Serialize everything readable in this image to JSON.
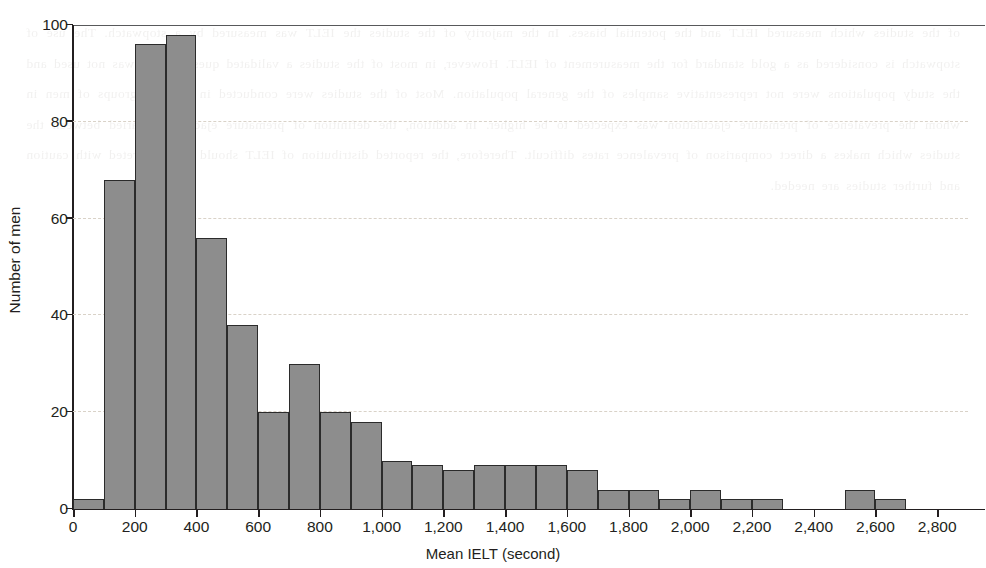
{
  "figure": {
    "y_axis_title": "Number of men",
    "x_axis_title": "Mean IELT (second)",
    "bar_fill_color": "#8d8d8d",
    "bar_stroke_color": "#2b2b2b",
    "gridline_color": "#d9d2c8",
    "axis_color": "#231f20"
  },
  "background_text": "of the studies which measured IELT and the potential biases. In the majority of the studies the IELT was measured by a stopwatch. The use of stopwatch is considered as a gold standard for the measurement of IELT. However, in most of the studies a validated questionnaire was not used and the study populations were not representative samples of the general population. Most of the studies were conducted in selected groups of men in whom the prevalence of premature ejaculation was expected to be higher. In addition, the definition of premature ejaculation varied between the studies which makes a direct comparison of prevalence rates difficult. Therefore, the reported distribution of IELT should be interpreted with caution and further studies are needed.",
  "chart_data": {
    "type": "bar",
    "title": "",
    "subtitle": "",
    "xlabel": "Mean IELT (second)",
    "ylabel": "Number of men",
    "bin_width": 100,
    "xlim": [
      0,
      2900
    ],
    "ylim": [
      0,
      100
    ],
    "grid": true,
    "legend": null,
    "x_tick_labels": [
      "0",
      "200",
      "400",
      "600",
      "800",
      "1,000",
      "1,200",
      "1,400",
      "1,600",
      "1,800",
      "2,000",
      "2,200",
      "2,400",
      "2,600",
      "2,800"
    ],
    "x_tick_values": [
      0,
      200,
      400,
      600,
      800,
      1000,
      1200,
      1400,
      1600,
      1800,
      2000,
      2200,
      2400,
      2600,
      2800
    ],
    "y_tick_labels": [
      "0",
      "20",
      "40",
      "60",
      "80",
      "100"
    ],
    "y_tick_values": [
      0,
      20,
      40,
      60,
      80,
      100
    ],
    "bins": [
      {
        "x0": 0,
        "x1": 100,
        "value": 2
      },
      {
        "x0": 100,
        "x1": 200,
        "value": 68
      },
      {
        "x0": 200,
        "x1": 300,
        "value": 96
      },
      {
        "x0": 300,
        "x1": 400,
        "value": 98
      },
      {
        "x0": 400,
        "x1": 500,
        "value": 56
      },
      {
        "x0": 500,
        "x1": 600,
        "value": 38
      },
      {
        "x0": 600,
        "x1": 700,
        "value": 20
      },
      {
        "x0": 700,
        "x1": 800,
        "value": 30
      },
      {
        "x0": 800,
        "x1": 900,
        "value": 20
      },
      {
        "x0": 900,
        "x1": 1000,
        "value": 18
      },
      {
        "x0": 1000,
        "x1": 1100,
        "value": 10
      },
      {
        "x0": 1100,
        "x1": 1200,
        "value": 9
      },
      {
        "x0": 1200,
        "x1": 1300,
        "value": 8
      },
      {
        "x0": 1300,
        "x1": 1400,
        "value": 9
      },
      {
        "x0": 1400,
        "x1": 1500,
        "value": 9
      },
      {
        "x0": 1500,
        "x1": 1600,
        "value": 9
      },
      {
        "x0": 1600,
        "x1": 1700,
        "value": 8
      },
      {
        "x0": 1700,
        "x1": 1800,
        "value": 4
      },
      {
        "x0": 1800,
        "x1": 1900,
        "value": 4
      },
      {
        "x0": 1900,
        "x1": 2000,
        "value": 2
      },
      {
        "x0": 2000,
        "x1": 2100,
        "value": 4
      },
      {
        "x0": 2100,
        "x1": 2200,
        "value": 2
      },
      {
        "x0": 2200,
        "x1": 2300,
        "value": 2
      },
      {
        "x0": 2300,
        "x1": 2400,
        "value": 0
      },
      {
        "x0": 2400,
        "x1": 2500,
        "value": 0
      },
      {
        "x0": 2500,
        "x1": 2600,
        "value": 4
      },
      {
        "x0": 2600,
        "x1": 2700,
        "value": 2
      },
      {
        "x0": 2700,
        "x1": 2800,
        "value": 0
      },
      {
        "x0": 2800,
        "x1": 2900,
        "value": 0
      }
    ]
  }
}
